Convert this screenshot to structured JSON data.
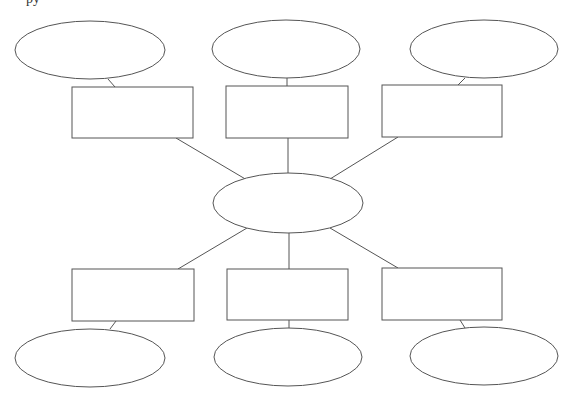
{
  "header": {
    "cropped_text": "py"
  },
  "colors": {
    "stroke": "#555555",
    "fill": "#ffffff",
    "background": "#ffffff"
  },
  "diagram": {
    "type": "spider-map",
    "center": {
      "shape": "ellipse",
      "cx": 288,
      "cy": 203,
      "rx": 75,
      "ry": 30,
      "label": ""
    },
    "branches": [
      {
        "id": "top-left",
        "rect": {
          "x": 72,
          "y": 87,
          "w": 121,
          "h": 51,
          "label": ""
        },
        "ellipse": {
          "cx": 90,
          "cy": 50,
          "rx": 75,
          "ry": 29,
          "label": ""
        },
        "edge_center": [
          176,
          138,
          247,
          180
        ],
        "edge_leaf": [
          108,
          79,
          115,
          87
        ]
      },
      {
        "id": "top-middle",
        "rect": {
          "x": 226,
          "y": 86,
          "w": 122,
          "h": 52,
          "label": ""
        },
        "ellipse": {
          "cx": 286,
          "cy": 49,
          "rx": 74,
          "ry": 29,
          "label": ""
        },
        "edge_center": [
          288,
          138,
          288,
          173
        ],
        "edge_leaf": [
          287,
          78,
          287,
          86
        ]
      },
      {
        "id": "top-right",
        "rect": {
          "x": 382,
          "y": 85,
          "w": 120,
          "h": 52,
          "label": ""
        },
        "ellipse": {
          "cx": 484,
          "cy": 49,
          "rx": 74,
          "ry": 29,
          "label": ""
        },
        "edge_center": [
          398,
          137,
          330,
          179
        ],
        "edge_leaf": [
          465,
          78,
          458,
          85
        ]
      },
      {
        "id": "bottom-left",
        "rect": {
          "x": 72,
          "y": 269,
          "w": 122,
          "h": 52,
          "label": ""
        },
        "ellipse": {
          "cx": 90,
          "cy": 358,
          "rx": 75,
          "ry": 29,
          "label": ""
        },
        "edge_center": [
          247,
          228,
          178,
          269
        ],
        "edge_leaf": [
          116,
          321,
          110,
          329
        ]
      },
      {
        "id": "bottom-middle",
        "rect": {
          "x": 227,
          "y": 269,
          "w": 121,
          "h": 51,
          "label": ""
        },
        "ellipse": {
          "cx": 288,
          "cy": 357,
          "rx": 74,
          "ry": 29,
          "label": ""
        },
        "edge_center": [
          289,
          232,
          289,
          269
        ],
        "edge_leaf": [
          289,
          320,
          289,
          328
        ]
      },
      {
        "id": "bottom-right",
        "rect": {
          "x": 382,
          "y": 268,
          "w": 120,
          "h": 52,
          "label": ""
        },
        "ellipse": {
          "cx": 484,
          "cy": 356,
          "rx": 74,
          "ry": 29,
          "label": ""
        },
        "edge_center": [
          330,
          228,
          398,
          268
        ],
        "edge_leaf": [
          460,
          320,
          465,
          328
        ]
      }
    ]
  }
}
